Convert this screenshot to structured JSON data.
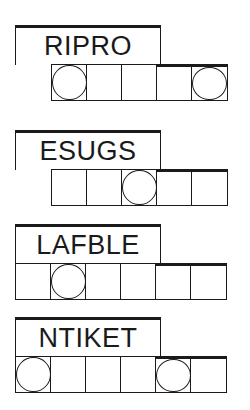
{
  "puzzles": [
    {
      "scrambled": "RIPRO",
      "top": 25,
      "cells_left": 51,
      "cell_count": 5,
      "circled": [
        1,
        5
      ],
      "thick_top_cells": [
        4,
        5
      ]
    },
    {
      "scrambled": "ESUGS",
      "top": 130,
      "cells_left": 51,
      "cell_count": 5,
      "circled": [
        3
      ],
      "thick_top_cells": [
        4,
        5
      ]
    },
    {
      "scrambled": "LAFBLE",
      "top": 224,
      "cells_left": 15,
      "cell_count": 6,
      "circled": [
        2
      ],
      "thick_top_cells": [
        5,
        6
      ]
    },
    {
      "scrambled": "NTIKET",
      "top": 317,
      "cells_left": 15,
      "cell_count": 6,
      "circled": [
        1,
        5
      ],
      "thick_top_cells": [
        5,
        6
      ]
    }
  ]
}
